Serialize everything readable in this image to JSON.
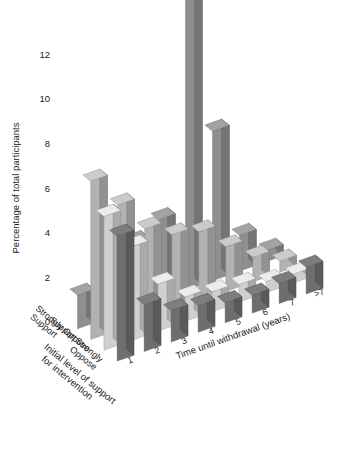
{
  "chart_data": {
    "type": "bar",
    "subtype": "3d-grouped-bar",
    "title": "",
    "xlabel": "Time until withdrawal (years)",
    "ylabel": "Percentage of total participants",
    "zlabel": "Initial level of support for intervention",
    "categories": [
      "1",
      "2",
      "3",
      "4",
      "5",
      "6",
      "7",
      ">7"
    ],
    "ylim": [
      0,
      13
    ],
    "yticks": [
      0,
      2,
      4,
      6,
      8,
      10,
      12
    ],
    "ytick_labels": [
      "0",
      "2",
      "4",
      "6",
      "8",
      "10",
      "12"
    ],
    "grid": false,
    "legend": "none",
    "series": [
      {
        "name": "Strongly Support",
        "color": "#8f8f8f",
        "values": [
          1.5,
          4.6,
          3.0,
          3.6,
          13.0,
          6.7,
          1.6,
          0.5
        ]
      },
      {
        "name": "Support",
        "color": "#b2b2b2",
        "values": [
          7.1,
          5.6,
          4.1,
          3.4,
          3.1,
          2.0,
          1.1,
          0.5
        ]
      },
      {
        "name": "Oppose",
        "color": "#cfcfcf",
        "values": [
          6.0,
          4.2,
          2.1,
          1.1,
          0.9,
          0.8,
          0.5,
          0.4
        ]
      },
      {
        "name": "Strongly Oppose",
        "color": "#6e6e6e",
        "values": [
          5.6,
          2.1,
          1.4,
          1.2,
          0.9,
          0.8,
          0.9,
          1.2
        ]
      }
    ],
    "axis_titles": {
      "y_axis_title": "Percentage of total participants",
      "x_axis_title": "Time until withdrawal (years)",
      "z_axis_title_line1": "Initial level of support",
      "z_axis_title_line2": "for intervention"
    },
    "z_categories": [
      {
        "line1": "Strongly",
        "line2": "Support"
      },
      {
        "line1": "Support",
        "line2": ""
      },
      {
        "line1": "Oppose",
        "line2": ""
      },
      {
        "line1": "Strongly",
        "line2": "Oppose"
      }
    ]
  }
}
